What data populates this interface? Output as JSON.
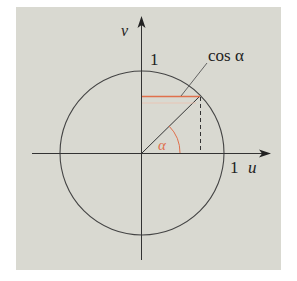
{
  "figure": {
    "background_color": "#d9d9d1",
    "line_color": "#333333",
    "accent_color": "#e0704c",
    "labels": {
      "v_axis": "v",
      "u_axis": "u",
      "unit_v": "1",
      "unit_u": "1",
      "cos_label": "cos α",
      "angle": "α"
    },
    "geometry": {
      "center": [
        142,
        153
      ],
      "radius": 82,
      "point_on_circle": [
        200,
        96
      ]
    }
  }
}
